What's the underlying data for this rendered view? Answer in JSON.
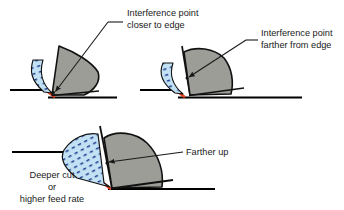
{
  "figure": {
    "background_color": "#ffffff",
    "width": 344,
    "height": 210
  },
  "colors": {
    "chip_fill": "#c3e1f4",
    "chip_dash": "#1b3c8c",
    "tool_fill": "#9d9d97",
    "tool_stroke": "#111111",
    "cut_edge_red": "#e8401f",
    "workpiece_line": "#000000",
    "leader_line": "#1a1a1a",
    "text": "#1a1a1a"
  },
  "panels": [
    {
      "id": "panel-top-left",
      "name": "shallow-cut-diagram",
      "caption": null,
      "annotation": {
        "id": "annotation-interference-closer",
        "lines": [
          "Interference point",
          "closer to edge"
        ],
        "text": "Interference point closer to edge",
        "leader": "elbow-with-arrow",
        "arrow_target": "interference-point-1"
      },
      "features": [
        "chip",
        "tool",
        "workpiece",
        "cut-edge",
        "interference-point"
      ]
    },
    {
      "id": "panel-top-right",
      "name": "steeper-rake-diagram",
      "caption": null,
      "annotation": {
        "id": "annotation-interference-farther",
        "lines": [
          "Interference point",
          "farther from edge"
        ],
        "text": "Interference point farther from edge",
        "leader": "elbow-with-arrow",
        "arrow_target": "interference-point-2"
      },
      "features": [
        "chip",
        "tool",
        "workpiece",
        "cut-edge",
        "interference-point"
      ]
    },
    {
      "id": "panel-bottom",
      "name": "deeper-cut-diagram",
      "caption": {
        "id": "caption-deeper-cut",
        "lines": [
          "Deeper cut",
          "or",
          "higher feed rate"
        ],
        "text": "Deeper cut or higher feed rate"
      },
      "annotation": {
        "id": "annotation-farther-up",
        "lines": [
          "Farther up"
        ],
        "text": "Farther up",
        "leader": "straight-with-arrow",
        "arrow_target": "interference-point-3"
      },
      "features": [
        "chip",
        "tool",
        "workpiece",
        "cut-edge",
        "interference-point"
      ]
    }
  ],
  "labels": {
    "interference_closer_line1": "Interference point",
    "interference_closer_line2": "closer to edge",
    "interference_farther_line1": "Interference point",
    "interference_farther_line2": "farther from edge",
    "farther_up": "Farther up",
    "deeper_cut_line1": "Deeper cut",
    "deeper_cut_line2": "or",
    "deeper_cut_line3": "higher feed rate"
  }
}
